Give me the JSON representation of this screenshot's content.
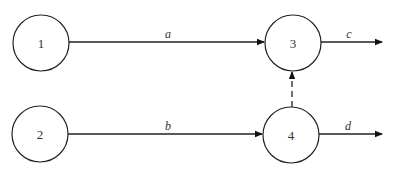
{
  "diagram": {
    "type": "directed-graph",
    "nodes": [
      {
        "id": "1",
        "label": "1"
      },
      {
        "id": "2",
        "label": "2"
      },
      {
        "id": "3",
        "label": "3"
      },
      {
        "id": "4",
        "label": "4"
      }
    ],
    "edges": [
      {
        "from": "1",
        "to": "3",
        "label": "a",
        "style": "solid"
      },
      {
        "from": "2",
        "to": "4",
        "label": "b",
        "style": "solid"
      },
      {
        "from": "3",
        "to": "out",
        "label": "c",
        "style": "solid"
      },
      {
        "from": "4",
        "to": "out",
        "label": "d",
        "style": "solid"
      },
      {
        "from": "4",
        "to": "3",
        "label": "",
        "style": "dashed"
      }
    ]
  }
}
